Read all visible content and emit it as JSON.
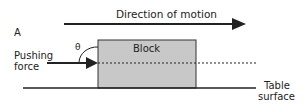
{
  "diagram": {
    "panel_label": "A",
    "direction_label": "Direction of motion",
    "block_label": "Block",
    "force_label_line1": "Pushing",
    "force_label_line2": "force",
    "angle_label": "θ",
    "surface_label_line1": "Table",
    "surface_label_line2": "surface",
    "colors": {
      "block_fill": "#c8c8c8",
      "stroke": "#222222",
      "background": "#ffffff"
    }
  }
}
